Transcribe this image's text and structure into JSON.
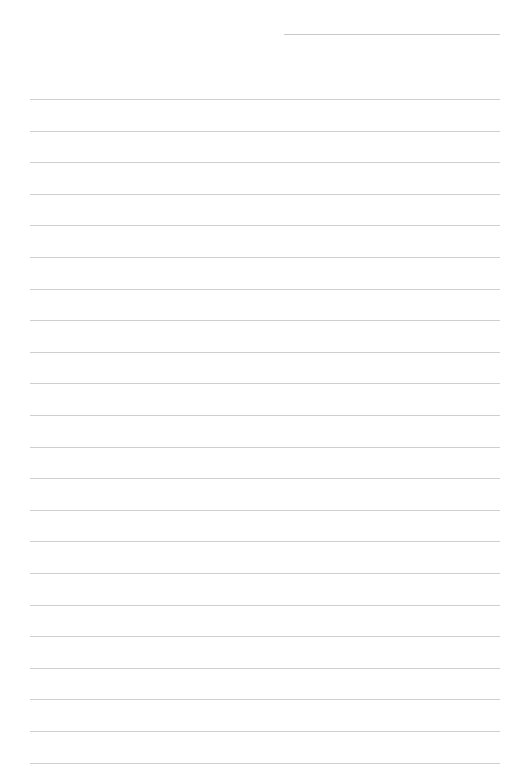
{
  "page": {
    "type": "blank lined paper",
    "header_line": {
      "label": ""
    },
    "line_count": 22,
    "first_line_y": 99,
    "line_spacing": 31.6,
    "line_color": "#cfcfcf",
    "background_color": "#ffffff",
    "lines": [
      "",
      "",
      "",
      "",
      "",
      "",
      "",
      "",
      "",
      "",
      "",
      "",
      "",
      "",
      "",
      "",
      "",
      "",
      "",
      "",
      "",
      ""
    ]
  }
}
